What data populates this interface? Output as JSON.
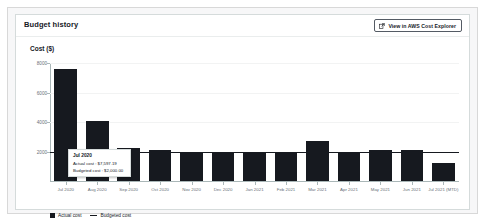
{
  "card": {
    "title": "Budget history",
    "cost_explorer_button": {
      "label": "View in AWS Cost Explorer",
      "icon": "external-link-icon"
    },
    "axis_unit_label": "Cost ($)"
  },
  "tooltip": {
    "title": "Jul 2020",
    "actual_row": "Actual cost : $7,597.19",
    "budgeted_row": "Budgeted cost : $2,000.00"
  },
  "legend": [
    {
      "label": "Actual cost",
      "marker": "square",
      "color": "#16191f"
    },
    {
      "label": "Budgeted cost",
      "marker": "line",
      "color": "#16191f"
    }
  ],
  "chart_data": {
    "type": "bar",
    "title": "Budget history",
    "xlabel": "",
    "ylabel": "Cost ($)",
    "ylim": [
      0,
      8000
    ],
    "yticks": [
      2000,
      4000,
      6000,
      8000
    ],
    "ytick_labels": [
      "2000",
      "4000",
      "6000",
      "8000"
    ],
    "grid": true,
    "legend_position": "bottom-left",
    "categories": [
      "Jul 2020",
      "Aug 2020",
      "Sep 2020",
      "Oct 2020",
      "Nov 2020",
      "Dec 2020",
      "Jan 2021",
      "Feb 2021",
      "Mar 2021",
      "Apr 2021",
      "May 2021",
      "Jun 2021",
      "Jul 2021 (MTD)"
    ],
    "series": [
      {
        "name": "Actual cost",
        "type": "bar",
        "color": "#16191f",
        "values": [
          7597.19,
          4100,
          2250,
          2130,
          1960,
          1950,
          1970,
          1940,
          2700,
          1900,
          2120,
          2100,
          1190
        ]
      },
      {
        "name": "Budgeted cost",
        "type": "line",
        "color": "#16191f",
        "values": [
          2000,
          2000,
          2000,
          2000,
          2000,
          2000,
          2000,
          2000,
          2000,
          2000,
          2000,
          2000,
          2000
        ]
      }
    ],
    "annotations": [
      {
        "category": "Jul 2020",
        "title": "Jul 2020",
        "actual_cost": "$7,597.19",
        "budgeted_cost": "$2,000.00"
      }
    ]
  }
}
